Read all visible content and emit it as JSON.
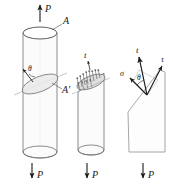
{
  "figure": {
    "colors": {
      "ink": "#1a1a1a",
      "outline": "#6e6e6e",
      "light_outline": "#9a9a9a",
      "fill": "#fbfbfb",
      "ellipse_fill": "#efefef",
      "background": "#ffffff"
    },
    "panels": [
      {
        "id": "panel-bar-with-section",
        "name": "cylinder-with-inclined-section",
        "labels": {
          "load_top": "P",
          "load_bottom": "P",
          "area_top": "A",
          "area_inclined": "A'",
          "angle": "θ"
        }
      },
      {
        "id": "panel-cut-bar-tractions",
        "name": "cut-cylinder-with-traction-vectors",
        "labels": {
          "traction": "t",
          "load_bottom": "P"
        }
      },
      {
        "id": "panel-stress-components",
        "name": "stress-component-resolution",
        "labels": {
          "traction": "t",
          "normal_stress": "σ",
          "shear_stress": "τ",
          "angle": "θ",
          "load_bottom": "P"
        }
      }
    ]
  }
}
